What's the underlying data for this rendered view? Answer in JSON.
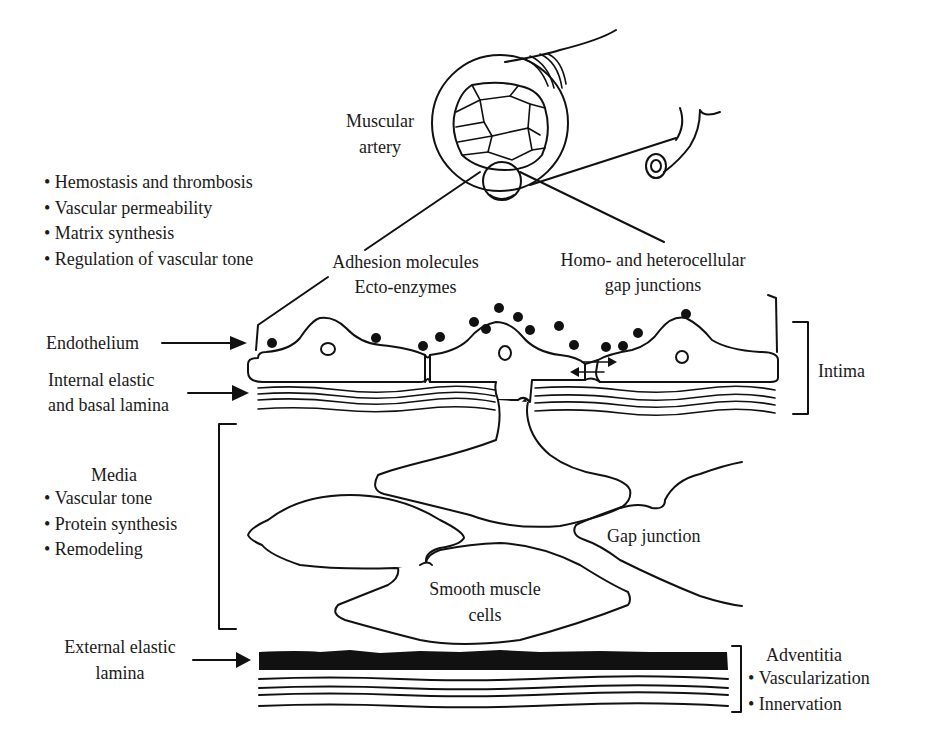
{
  "figure": {
    "top_vessel_label": "Muscular\nartery",
    "top_vessel_label_lines": [
      "Muscular",
      "artery"
    ],
    "endothelial_functions": [
      "Hemostasis and thrombosis",
      "Vascular permeability",
      "Matrix synthesis",
      "Regulation of vascular tone"
    ],
    "callout_adhesion_lines": [
      "Adhesion molecules",
      "Ecto-enzymes"
    ],
    "callout_gap_lines": [
      "Homo- and heterocellular",
      "gap junctions"
    ],
    "endothelium_label": "Endothelium",
    "internal_lamina_lines": [
      "Internal elastic",
      "and basal lamina"
    ],
    "intima_label": "Intima",
    "media": {
      "title": "Media",
      "functions": [
        "Vascular tone",
        "Protein synthesis",
        "Remodeling"
      ]
    },
    "gap_junction_label": "Gap junction",
    "smooth_muscle_lines": [
      "Smooth muscle",
      "cells"
    ],
    "external_lamina_lines": [
      "External elastic",
      "lamina"
    ],
    "adventitia": {
      "title": "Adventitia",
      "functions": [
        "Vascularization",
        "Innervation"
      ]
    },
    "colors": {
      "ink": "#111111",
      "background": "#ffffff"
    }
  }
}
